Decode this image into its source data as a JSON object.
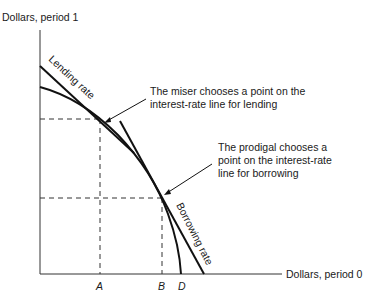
{
  "axes": {
    "y_label": "Dollars, period 1",
    "x_label": "Dollars, period 0",
    "x_ticks": [
      "A",
      "B",
      "D"
    ]
  },
  "lines": {
    "lending": "Lending rate",
    "borrowing": "Borrowing rate"
  },
  "annotations": {
    "miser_line1": "The miser chooses a point on the",
    "miser_line2": "interest-rate line for lending",
    "prodigal_line1": "The prodigal chooses a",
    "prodigal_line2": "point on the interest-rate",
    "prodigal_line3": "line for borrowing"
  }
}
